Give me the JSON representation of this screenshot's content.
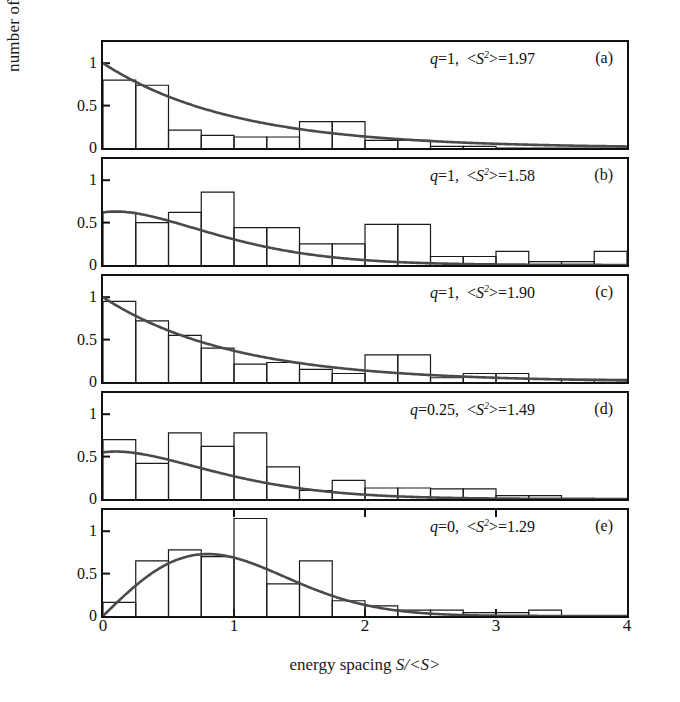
{
  "figure": {
    "ylabel": "number of levels (normalized)",
    "xlabel_prefix": "energy spacing ",
    "xlabel_symbol": "S/<S>",
    "axis_color": "#111111",
    "curve_color": "#4a4a4a",
    "bar_color": "#1a1a1a"
  },
  "chart_data": {
    "type": "bar",
    "title": "",
    "xlabel": "energy spacing S/<S>",
    "ylabel": "number of levels (normalized)",
    "xlim": [
      0,
      4
    ],
    "ylim": [
      0,
      1.25
    ],
    "xticks": [
      0,
      1,
      2,
      3,
      4
    ],
    "xtick_labels": [
      "0",
      "1",
      "2",
      "3",
      "4"
    ],
    "yticks": [
      0,
      0.5,
      1
    ],
    "ytick_labels": [
      "0",
      "0.5",
      "1"
    ],
    "grid": false,
    "legend": "none",
    "bin_width": 0.25,
    "panels": [
      {
        "tag": "(a)",
        "q": "1",
        "s2": "1.97",
        "note_q": "q=1,",
        "note_s2": "<S2>=1.97",
        "bin_edges": [
          0,
          0.25,
          0.5,
          0.75,
          1.0,
          1.25,
          1.5,
          1.75,
          2.0,
          2.25,
          2.5,
          2.75,
          3.0,
          3.25,
          3.5,
          3.75,
          4.0
        ],
        "values": [
          0.8,
          0.74,
          0.21,
          0.15,
          0.13,
          0.13,
          0.31,
          0.31,
          0.09,
          0.09,
          0.02,
          0.02,
          0.0,
          0.0,
          0.0,
          0.0
        ],
        "curve": {
          "kind": "poisson",
          "formula": "P(S)=exp(-S)",
          "amplitude": 1.0
        }
      },
      {
        "tag": "(b)",
        "q": "1",
        "s2": "1.58",
        "note_q": "q=1,",
        "note_s2": "<S2>=1.58",
        "bin_edges": [
          0,
          0.25,
          0.5,
          0.75,
          1.0,
          1.25,
          1.5,
          1.75,
          2.0,
          2.25,
          2.5,
          2.75,
          3.0,
          3.25,
          3.5,
          3.75,
          4.0
        ],
        "values": [
          0.62,
          0.5,
          0.62,
          0.86,
          0.44,
          0.44,
          0.25,
          0.25,
          0.48,
          0.48,
          0.1,
          0.1,
          0.16,
          0.04,
          0.04,
          0.16
        ],
        "curve": {
          "kind": "brody",
          "formula": "intermediate",
          "amplitude": 0.62,
          "peak_x": 0.8
        }
      },
      {
        "tag": "(c)",
        "q": "1",
        "s2": "1.90",
        "note_q": "q=1,",
        "note_s2": "<S2>=1.90",
        "bin_edges": [
          0,
          0.25,
          0.5,
          0.75,
          1.0,
          1.25,
          1.5,
          1.75,
          2.0,
          2.25,
          2.5,
          2.75,
          3.0,
          3.25,
          3.5,
          3.75,
          4.0
        ],
        "values": [
          0.95,
          0.72,
          0.55,
          0.4,
          0.21,
          0.23,
          0.15,
          0.1,
          0.32,
          0.32,
          0.05,
          0.1,
          0.1,
          0.04,
          0.03,
          0.03
        ],
        "curve": {
          "kind": "poisson",
          "formula": "P(S)=exp(-S)",
          "amplitude": 1.0
        }
      },
      {
        "tag": "(d)",
        "q": "0.25",
        "s2": "1.49",
        "note_q": "q=0.25,",
        "note_s2": "<S2>=1.49",
        "bin_edges": [
          0,
          0.25,
          0.5,
          0.75,
          1.0,
          1.25,
          1.5,
          1.75,
          2.0,
          2.25,
          2.5,
          2.75,
          3.0,
          3.25,
          3.5,
          3.75,
          4.0
        ],
        "values": [
          0.7,
          0.42,
          0.78,
          0.62,
          0.78,
          0.38,
          0.1,
          0.22,
          0.13,
          0.13,
          0.12,
          0.12,
          0.04,
          0.04,
          0.0,
          0.0
        ],
        "curve": {
          "kind": "brody",
          "formula": "intermediate",
          "amplitude": 0.55,
          "peak_x": 0.82
        }
      },
      {
        "tag": "(e)",
        "q": "0",
        "s2": "1.29",
        "note_q": "q=0,",
        "note_s2": "<S2>=1.29",
        "bin_edges": [
          0,
          0.25,
          0.5,
          0.75,
          1.0,
          1.25,
          1.5,
          1.75,
          2.0,
          2.25,
          2.5,
          2.75,
          3.0,
          3.25,
          3.5,
          3.75,
          4.0
        ],
        "values": [
          0.16,
          0.65,
          0.78,
          0.7,
          1.15,
          0.38,
          0.65,
          0.18,
          0.12,
          0.07,
          0.07,
          0.04,
          0.04,
          0.07,
          0.0,
          0.0
        ],
        "curve": {
          "kind": "wigner",
          "formula": "P(S)=(pi/2)S exp(-pi S^2/4)",
          "amplitude": 0.73,
          "peak_x": 0.92
        }
      }
    ]
  }
}
